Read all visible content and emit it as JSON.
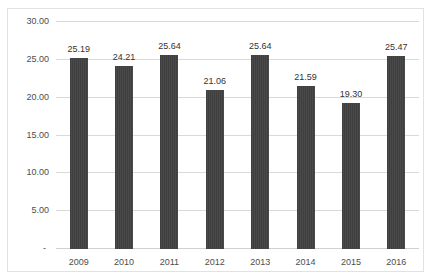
{
  "title_fragment": "▁▁▁ ▁▁▁▁▁▁ ▁▁",
  "colors": {
    "bar": "#3f3f3f",
    "gridline": "#d9d9d9",
    "frame": "#e2e2e2",
    "tick_text": "#4d4d4d",
    "label_text": "#333333",
    "background": "#ffffff"
  },
  "chart_data": {
    "type": "bar",
    "title": "",
    "xlabel": "",
    "ylabel": "",
    "categories": [
      "2009",
      "2010",
      "2011",
      "2012",
      "2013",
      "2014",
      "2015",
      "2016"
    ],
    "values": [
      25.19,
      24.21,
      25.64,
      21.06,
      25.64,
      21.59,
      19.3,
      25.47
    ],
    "data_labels": [
      "25.19",
      "24.21",
      "25.64",
      "21.06",
      "25.64",
      "21.59",
      "19.30",
      "25.47"
    ],
    "ylim": [
      0,
      30
    ],
    "ytick_values": [
      0,
      5,
      10,
      15,
      20,
      25,
      30
    ],
    "ytick_labels": [
      "-",
      "5.00",
      "10.00",
      "15.00",
      "20.00",
      "25.00",
      "30.00"
    ],
    "grid": "horizontal",
    "legend": "none",
    "orientation": "vertical"
  }
}
